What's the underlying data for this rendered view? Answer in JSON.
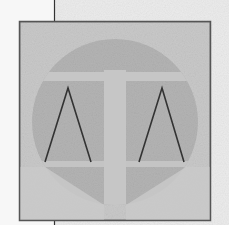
{
  "figure": {
    "colors": {
      "page_background": "#f7f7f7",
      "top_panel": "#ececec",
      "box_fill": "#c9c9c9",
      "box_border": "#555555",
      "circle_fill": "#b4b4b4",
      "pillar_fill": "#c6c6c6",
      "beam_fill": "#c6c6c6",
      "base_fill": "#c9c9c9",
      "pan_stroke": "#333333",
      "guide_line": "#333333"
    },
    "box": {
      "x": 19,
      "y": 21,
      "width": 192,
      "height": 200
    },
    "circle": {
      "cx": 115,
      "cy": 122,
      "r": 83
    },
    "pillar": {
      "x": 104,
      "y": 70,
      "width": 22,
      "height": 145
    },
    "beam": {
      "x": 28,
      "y": 72,
      "width": 174,
      "height": 9
    },
    "left_pan": {
      "apex": [
        68,
        88
      ],
      "left": [
        45,
        162
      ],
      "right": [
        91,
        162
      ]
    },
    "right_pan": {
      "apex": [
        162,
        88
      ],
      "left": [
        139,
        162
      ],
      "right": [
        184,
        162
      ]
    },
    "guide_line_x": 54
  }
}
